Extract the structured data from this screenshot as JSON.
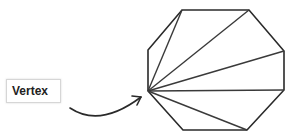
{
  "diagram": {
    "label": "Vertex",
    "colors": {
      "stroke": "#2a2a2a",
      "diagonal": "#3a3a3a",
      "label_border": "#d6d6d6",
      "label_text": "#222222"
    },
    "octagon": {
      "vertices": [
        [
          182,
          10
        ],
        [
          249,
          10
        ],
        [
          284,
          51
        ],
        [
          284,
          90
        ],
        [
          247,
          130
        ],
        [
          183,
          130
        ],
        [
          148,
          91
        ],
        [
          148,
          50
        ]
      ],
      "source_vertex": [
        148,
        91
      ]
    },
    "diagonals_to": [
      [
        182,
        10
      ],
      [
        249,
        10
      ],
      [
        284,
        51
      ],
      [
        284,
        90
      ],
      [
        247,
        130
      ]
    ],
    "arrow": {
      "from": [
        70,
        108
      ],
      "to": [
        141,
        97
      ]
    }
  }
}
